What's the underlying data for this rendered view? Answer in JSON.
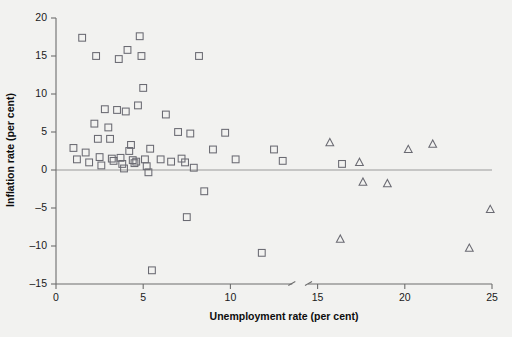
{
  "chart_data": {
    "type": "scatter",
    "title": "",
    "xlabel": "Unemployment rate (per cent)",
    "ylabel": "Inflation rate (per cent)",
    "xlim": [
      0,
      25
    ],
    "ylim": [
      -15,
      20
    ],
    "xticks": [
      0,
      5,
      10,
      15,
      20,
      25
    ],
    "yticks": [
      -15,
      -10,
      -5,
      0,
      5,
      10,
      15,
      20
    ],
    "xticklabels": [
      "0",
      "5",
      "10",
      "15",
      "20",
      "25"
    ],
    "yticklabels": [
      "-15",
      "-10",
      "-5",
      "0",
      "5",
      "10",
      "15",
      "20"
    ],
    "grid": false,
    "legend": "none",
    "axis_break_x": 14.0,
    "zero_reference_line": 0,
    "series": [
      {
        "name": "squares",
        "marker": "square",
        "color": "#6a6a72",
        "points": [
          [
            1.0,
            2.9
          ],
          [
            1.2,
            1.4
          ],
          [
            1.5,
            17.4
          ],
          [
            1.7,
            2.3
          ],
          [
            1.9,
            1.0
          ],
          [
            2.2,
            6.1
          ],
          [
            2.3,
            15.0
          ],
          [
            2.4,
            4.1
          ],
          [
            2.5,
            1.7
          ],
          [
            2.6,
            0.6
          ],
          [
            2.8,
            8.0
          ],
          [
            3.0,
            5.6
          ],
          [
            3.1,
            4.1
          ],
          [
            3.2,
            1.5
          ],
          [
            3.3,
            1.2
          ],
          [
            3.5,
            7.9
          ],
          [
            3.6,
            14.6
          ],
          [
            3.7,
            1.6
          ],
          [
            3.8,
            0.8
          ],
          [
            3.9,
            0.2
          ],
          [
            4.0,
            7.7
          ],
          [
            4.1,
            15.8
          ],
          [
            4.2,
            2.5
          ],
          [
            4.3,
            3.3
          ],
          [
            4.4,
            1.3
          ],
          [
            4.5,
            0.9
          ],
          [
            4.6,
            1.1
          ],
          [
            4.7,
            8.5
          ],
          [
            4.8,
            17.6
          ],
          [
            4.9,
            15.0
          ],
          [
            5.0,
            10.8
          ],
          [
            5.1,
            1.4
          ],
          [
            5.2,
            0.5
          ],
          [
            5.3,
            -0.3
          ],
          [
            5.4,
            2.8
          ],
          [
            5.5,
            -13.2
          ],
          [
            6.0,
            1.4
          ],
          [
            6.3,
            7.3
          ],
          [
            6.6,
            1.1
          ],
          [
            7.0,
            5.0
          ],
          [
            7.2,
            1.5
          ],
          [
            7.4,
            1.0
          ],
          [
            7.5,
            -6.2
          ],
          [
            7.7,
            4.8
          ],
          [
            7.9,
            0.3
          ],
          [
            8.2,
            15.0
          ],
          [
            8.5,
            -2.8
          ],
          [
            9.0,
            2.7
          ],
          [
            9.7,
            4.9
          ],
          [
            10.3,
            1.4
          ],
          [
            11.8,
            -10.9
          ],
          [
            12.5,
            2.7
          ],
          [
            13.0,
            1.2
          ],
          [
            16.4,
            0.8
          ]
        ]
      },
      {
        "name": "triangles",
        "marker": "triangle",
        "color": "#6a6a72",
        "points": [
          [
            15.7,
            3.6
          ],
          [
            16.3,
            -9.1
          ],
          [
            17.4,
            1.0
          ],
          [
            17.6,
            -1.6
          ],
          [
            19.0,
            -1.8
          ],
          [
            20.2,
            2.7
          ],
          [
            21.6,
            3.4
          ],
          [
            23.7,
            -10.3
          ],
          [
            24.9,
            -5.2
          ]
        ]
      }
    ]
  }
}
